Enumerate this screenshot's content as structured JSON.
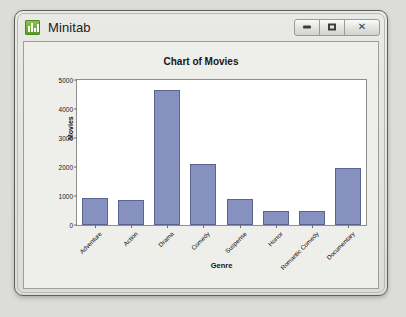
{
  "window": {
    "title": "Minitab",
    "icon": "bar-chart-icon",
    "controls": {
      "minimize_label": "Minimize",
      "maximize_label": "Maximize",
      "close_label": "Close"
    }
  },
  "chart_data": {
    "type": "bar",
    "title": "Chart of Movies",
    "xlabel": "Genre",
    "ylabel": "Movies",
    "categories": [
      "Adventure",
      "Action",
      "Drama",
      "Comedy",
      "Suspense",
      "Horror",
      "Romantic Comedy",
      "Documentary"
    ],
    "values": [
      930,
      850,
      4650,
      2120,
      900,
      500,
      490,
      1980
    ],
    "ylim": [
      0,
      5000
    ],
    "yticks": [
      0,
      1000,
      2000,
      3000,
      4000,
      5000
    ],
    "ytick_labels": [
      "0",
      "1000",
      "2000",
      "3000",
      "4000",
      "5000"
    ],
    "grid": false,
    "legend": null,
    "bar_color": "#8791bf",
    "bar_border_color": "#5b6490",
    "plot_background": "#ffffff",
    "panel_background": "#eeeeeb"
  }
}
